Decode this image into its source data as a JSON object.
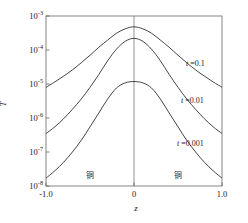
{
  "chart_data": {
    "type": "line",
    "title": "",
    "xlabel": "z",
    "ylabel": "T",
    "yscale": "log",
    "xlim": [
      -1.0,
      1.0
    ],
    "ylim": [
      1e-08,
      0.001
    ],
    "grid": false,
    "legend_position": "inline-right",
    "xticks": [
      -1.0,
      0,
      1.0
    ],
    "xticklabels": [
      "-1.0",
      "0",
      "1.0"
    ],
    "yticks": [
      0.001,
      0.0001,
      1e-05,
      1e-06,
      1e-07,
      1e-08
    ],
    "yticklabels": [
      "10",
      "10",
      "10",
      "10",
      "10",
      "10"
    ],
    "yticksuperscripts": [
      "-3",
      "-4",
      "-5",
      "-6",
      "-7",
      "-8"
    ],
    "annotations": [
      {
        "text": "铜",
        "x": -0.5,
        "note": "copper-region-left"
      },
      {
        "text": "铜",
        "x": 0.5,
        "note": "copper-region-right"
      }
    ],
    "vertical_line_x": 0,
    "series": [
      {
        "name": "t =0.1",
        "label": "t =0.1",
        "t": 0.1,
        "x": [
          -1.0,
          -0.9,
          -0.8,
          -0.7,
          -0.6,
          -0.5,
          -0.4,
          -0.3,
          -0.2,
          -0.1,
          0.0,
          0.1,
          0.2,
          0.3,
          0.4,
          0.5,
          0.6,
          0.7,
          0.8,
          0.9,
          1.0
        ],
        "y": [
          8e-06,
          1.15e-05,
          1.7e-05,
          2.6e-05,
          4.2e-05,
          7e-05,
          0.00012,
          0.000195,
          0.00031,
          0.00042,
          0.00048,
          0.00042,
          0.00031,
          0.000195,
          0.00012,
          7e-05,
          4.2e-05,
          2.6e-05,
          1.7e-05,
          1.15e-05,
          8e-06
        ]
      },
      {
        "name": "t =0.01",
        "label": "t =0.01",
        "t": 0.01,
        "x": [
          -1.0,
          -0.9,
          -0.8,
          -0.7,
          -0.6,
          -0.5,
          -0.4,
          -0.3,
          -0.2,
          -0.1,
          0.0,
          0.1,
          0.2,
          0.3,
          0.4,
          0.5,
          0.6,
          0.7,
          0.8,
          0.9,
          1.0
        ],
        "y": [
          3.5e-07,
          5.5e-07,
          9.5e-07,
          1.8e-06,
          3.6e-06,
          8e-06,
          1.9e-05,
          4.8e-05,
          0.000105,
          0.00018,
          0.00022,
          0.00018,
          0.000105,
          4.8e-05,
          1.9e-05,
          8e-06,
          3.6e-06,
          1.8e-06,
          9.5e-07,
          5.5e-07,
          3.5e-07
        ]
      },
      {
        "name": "t =0.001",
        "label": "t =0.001",
        "t": 0.001,
        "x": [
          -1.0,
          -0.9,
          -0.8,
          -0.7,
          -0.6,
          -0.5,
          -0.4,
          -0.3,
          -0.2,
          -0.1,
          0.0,
          0.1,
          0.2,
          0.3,
          0.4,
          0.5,
          0.6,
          0.7,
          0.8,
          0.9,
          1.0
        ],
        "y": [
          1.7e-08,
          2.8e-08,
          5e-08,
          1e-07,
          2.2e-07,
          5.5e-07,
          1.4e-06,
          3.6e-06,
          7.6e-06,
          1.08e-05,
          1.18e-05,
          1.08e-05,
          7.6e-06,
          3.6e-06,
          1.4e-06,
          5.5e-07,
          2.2e-07,
          1e-07,
          5e-08,
          2.8e-08,
          1.7e-08
        ]
      }
    ],
    "colors": {
      "curve": "#3a3a3a",
      "axis": "#555555",
      "text": "#1a1a1a",
      "background": "#ffffff"
    }
  }
}
